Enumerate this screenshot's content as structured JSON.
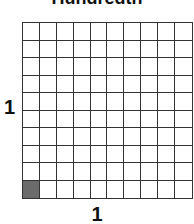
{
  "title": "Hundredth",
  "grid": {
    "rows": 10,
    "columns": 10,
    "shaded_cells": [
      {
        "row": 9,
        "col": 0
      }
    ],
    "shaded_color": "#6b6b6b",
    "line_color": "#333333"
  },
  "labels": {
    "side": "1",
    "bottom": "1"
  }
}
